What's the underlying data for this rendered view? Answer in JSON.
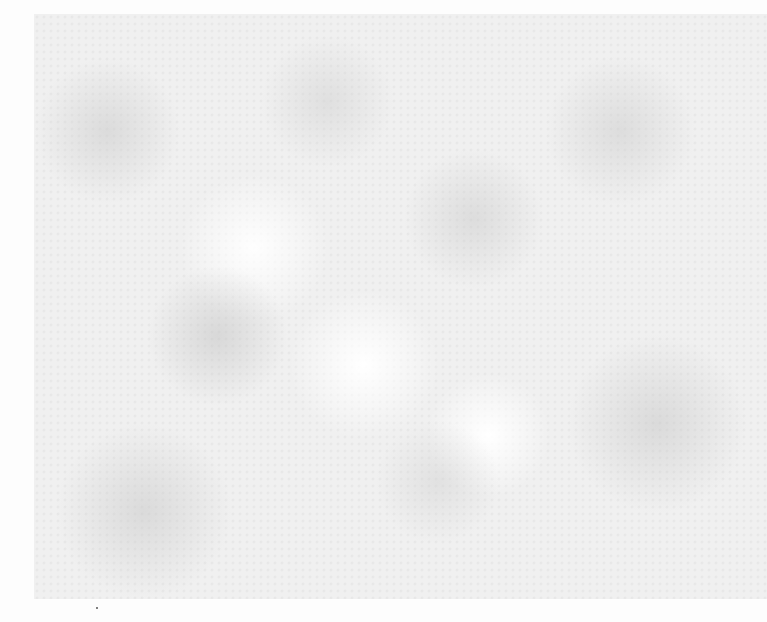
{
  "page": {
    "background_color": "#fdfdfd",
    "texture_color": "#eeeeee"
  }
}
